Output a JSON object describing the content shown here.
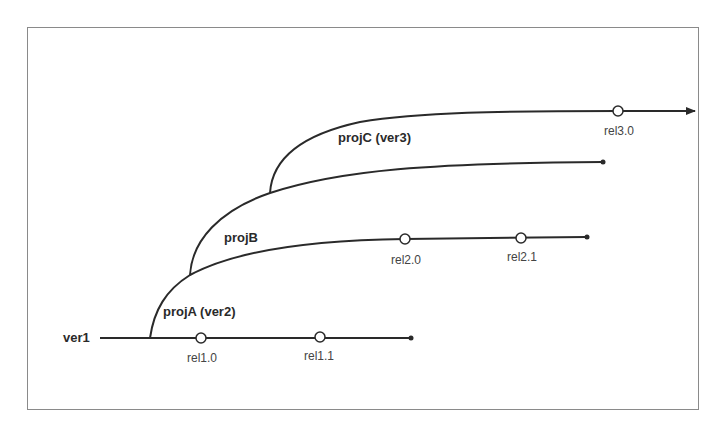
{
  "diagram": {
    "type": "version-branch-tree",
    "trunk": {
      "label": "ver1",
      "releases": [
        {
          "label": "rel1.0"
        },
        {
          "label": "rel1.1"
        }
      ]
    },
    "branches": [
      {
        "id": "projA",
        "label": "projA (ver2)",
        "parent": "ver1",
        "releases": [
          {
            "label": "rel2.0"
          },
          {
            "label": "rel2.1"
          }
        ]
      },
      {
        "id": "projB",
        "label": "projB",
        "parent": "projA",
        "releases": []
      },
      {
        "id": "projC",
        "label": "projC (ver3)",
        "parent": "projB",
        "releases": [
          {
            "label": "rel3.0"
          }
        ],
        "continues": true
      }
    ],
    "colors": {
      "line": "#2a2a2a",
      "frame": "#8a8a8a",
      "background": "#ffffff"
    }
  }
}
